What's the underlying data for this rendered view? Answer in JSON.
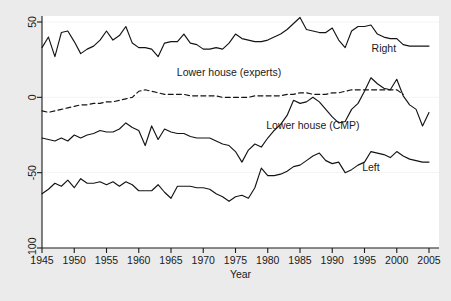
{
  "chart_data": {
    "type": "line",
    "title": "",
    "subtitle": "",
    "xlabel": "Year",
    "ylabel": "",
    "xlim": [
      1945,
      2005
    ],
    "ylim": [
      -100,
      50
    ],
    "xticks": [
      1945,
      1950,
      1955,
      1960,
      1965,
      1970,
      1975,
      1980,
      1985,
      1990,
      1995,
      2000,
      2005
    ],
    "yticks": [
      -100,
      -50,
      0,
      50
    ],
    "xtick_labels": [
      "1945",
      "1950",
      "1955",
      "1960",
      "1965",
      "1970",
      "1975",
      "1980",
      "1985",
      "1990",
      "1995",
      "2000",
      "2005"
    ],
    "ytick_labels": [
      "-100",
      "-50",
      "0",
      "50"
    ],
    "grid": false,
    "legend_position": "inline-annotations",
    "x": [
      1945,
      1946,
      1947,
      1948,
      1949,
      1950,
      1951,
      1952,
      1953,
      1954,
      1955,
      1956,
      1957,
      1958,
      1959,
      1960,
      1961,
      1962,
      1963,
      1964,
      1965,
      1966,
      1967,
      1968,
      1969,
      1970,
      1971,
      1972,
      1973,
      1974,
      1975,
      1976,
      1977,
      1978,
      1979,
      1980,
      1981,
      1982,
      1983,
      1984,
      1985,
      1986,
      1987,
      1988,
      1989,
      1990,
      1991,
      1992,
      1993,
      1994,
      1995,
      1996,
      1997,
      1998,
      1999,
      2000,
      2001,
      2002,
      2003,
      2004,
      2005
    ],
    "series": [
      {
        "name": "Right",
        "style": "solid",
        "label_x": 1998,
        "label_y": 30,
        "values": [
          33,
          40,
          27,
          43,
          44,
          37,
          29,
          32,
          34,
          38,
          44,
          38,
          41,
          47,
          36,
          33,
          33,
          32,
          27,
          36,
          37,
          37,
          42,
          36,
          35,
          32,
          32,
          33,
          32,
          36,
          42,
          39,
          38,
          37,
          37,
          38,
          40,
          42,
          45,
          49,
          53,
          45,
          44,
          43,
          43,
          46,
          38,
          33,
          44,
          47,
          47,
          48,
          42,
          40,
          39,
          39,
          35,
          34,
          34,
          34,
          34
        ]
      },
      {
        "name": "Lower house (experts)",
        "style": "dashed",
        "label_x": 1974,
        "label_y": 14,
        "values": [
          -9,
          -10,
          -9,
          -8,
          -7,
          -6,
          -5,
          -5,
          -4,
          -4,
          -3,
          -3,
          -2,
          -1,
          0,
          4,
          5,
          4,
          3,
          2,
          2,
          2,
          2,
          1,
          1,
          1,
          1,
          1,
          0,
          0,
          0,
          0,
          0,
          1,
          1,
          1,
          1,
          1,
          2,
          2,
          3,
          3,
          2,
          2,
          2,
          3,
          3,
          4,
          5,
          5,
          5,
          5,
          5,
          5,
          5,
          5,
          2,
          null,
          null,
          null,
          null
        ]
      },
      {
        "name": "Lower house (CMP)",
        "style": "solid",
        "label_x": 1987,
        "label_y": -21,
        "values": [
          -27,
          -28,
          -29,
          -27,
          -29,
          -25,
          -27,
          -25,
          -24,
          -22,
          -23,
          -23,
          -21,
          -17,
          -20,
          -22,
          -32,
          -19,
          -28,
          -21,
          -23,
          -24,
          -24,
          -26,
          -27,
          -27,
          -27,
          -29,
          -31,
          -32,
          -36,
          -43,
          -35,
          -31,
          -33,
          -27,
          -22,
          -18,
          -12,
          -2,
          -4,
          -3,
          0,
          -3,
          -8,
          -13,
          -17,
          -16,
          -8,
          -4,
          4,
          13,
          9,
          6,
          5,
          12,
          1,
          -5,
          -8,
          -19,
          -10
        ]
      },
      {
        "name": "Left",
        "style": "solid",
        "label_x": 1996,
        "label_y": -49,
        "values": [
          -64,
          -61,
          -57,
          -59,
          -55,
          -60,
          -54,
          -57,
          -57,
          -56,
          -58,
          -56,
          -59,
          -56,
          -58,
          -62,
          -62,
          -62,
          -58,
          -63,
          -67,
          -59,
          -59,
          -59,
          -60,
          -60,
          -61,
          -64,
          -66,
          -69,
          -66,
          -65,
          -67,
          -60,
          -47,
          -52,
          -52,
          -51,
          -49,
          -46,
          -45,
          -42,
          -39,
          -37,
          -42,
          -44,
          -43,
          -50,
          -48,
          -45,
          -43,
          -36,
          -37,
          -38,
          -40,
          -36,
          -39,
          -41,
          -42,
          -43,
          -43
        ]
      }
    ]
  }
}
